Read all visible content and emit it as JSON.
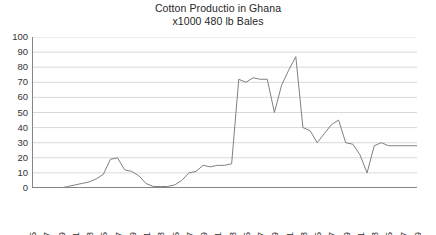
{
  "chart_data": {
    "type": "line",
    "title": "Cotton Productio in Ghana",
    "subtitle": "x1000 480 lb Bales",
    "xlabel": "",
    "ylabel": "",
    "ylim": [
      0,
      100
    ],
    "ytick_step": 10,
    "yticks": [
      100,
      90,
      80,
      70,
      60,
      50,
      40,
      30,
      20,
      10,
      0
    ],
    "grid": true,
    "grid_axis": "y",
    "legend": false,
    "legend_position": "none",
    "line_color": "#808080",
    "grid_color": "#d9d9d9",
    "axis_color": "#868686",
    "text_color": "#333333",
    "x_tick_labels": [
      "1965",
      "1967",
      "1969",
      "1971",
      "1973",
      "1975",
      "1977",
      "1979",
      "1981",
      "1983",
      "1985",
      "1987",
      "1989",
      "1991",
      "1993",
      "1995",
      "1997",
      "1999",
      "2001",
      "2003",
      "2005",
      "2007",
      "2009",
      "2011",
      "2013",
      "2015",
      "2017",
      "2019"
    ],
    "x_tick_step": 2,
    "x": [
      1965,
      1966,
      1967,
      1968,
      1969,
      1970,
      1971,
      1972,
      1973,
      1974,
      1975,
      1976,
      1977,
      1978,
      1979,
      1980,
      1981,
      1982,
      1983,
      1984,
      1985,
      1986,
      1987,
      1988,
      1989,
      1990,
      1991,
      1992,
      1993,
      1994,
      1995,
      1996,
      1997,
      1998,
      1999,
      2000,
      2001,
      2002,
      2003,
      2004,
      2005,
      2006,
      2007,
      2008,
      2009,
      2010,
      2011,
      2012,
      2013,
      2014,
      2015,
      2016,
      2017,
      2018,
      2019
    ],
    "values": [
      0,
      0,
      0,
      0,
      0,
      1,
      2,
      3,
      4,
      6,
      9,
      19,
      20,
      12,
      11,
      8,
      3,
      1,
      1,
      1,
      2,
      5,
      10,
      11,
      15,
      14,
      15,
      15,
      16,
      72,
      70,
      73,
      72,
      72,
      50,
      68,
      78,
      87,
      40,
      38,
      30,
      36,
      42,
      45,
      30,
      29,
      22,
      10,
      28,
      30,
      28,
      28,
      28,
      28,
      28
    ]
  }
}
